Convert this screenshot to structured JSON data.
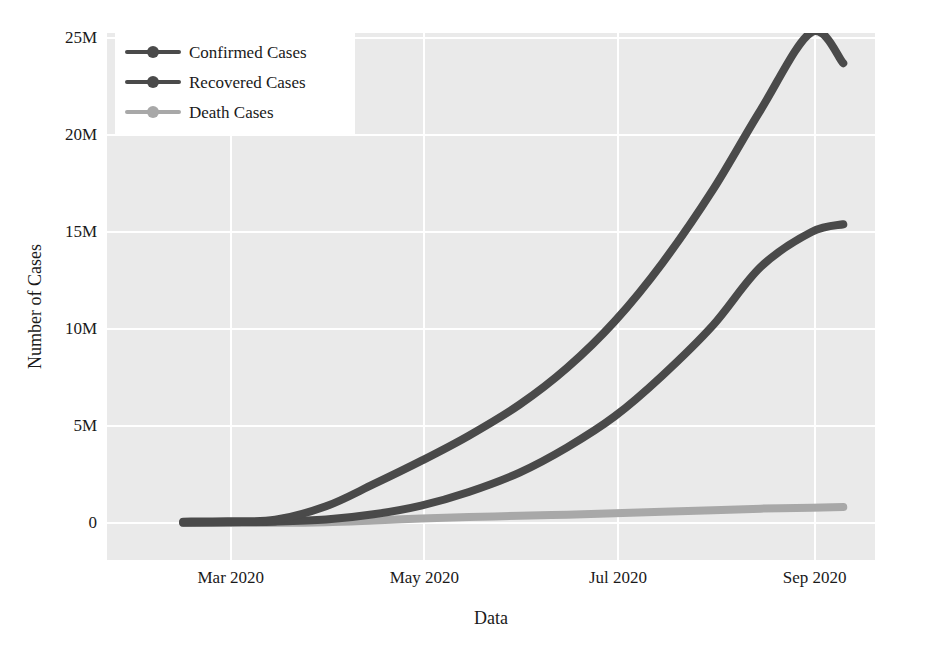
{
  "chart_data": {
    "type": "line",
    "title": "",
    "xlabel": "Data",
    "ylabel": "Number of Cases",
    "grid": true,
    "legend_position": "top-left",
    "x_tick_labels": [
      "Mar 2020",
      "May 2020",
      "Jul 2020",
      "Sep 2020"
    ],
    "x_tick_months": [
      2,
      4,
      6,
      8
    ],
    "y_tick_labels": [
      "0",
      "5M",
      "10M",
      "15M",
      "20M",
      "25M"
    ],
    "y_tick_values": [
      0,
      5000000,
      10000000,
      15000000,
      20000000,
      25000000
    ],
    "ylim": [
      0,
      25000000
    ],
    "xlim": [
      "2020-01-22",
      "2020-09-20"
    ],
    "x": [
      "2020-02-15",
      "2020-02-29",
      "2020-03-15",
      "2020-03-31",
      "2020-04-15",
      "2020-04-30",
      "2020-05-15",
      "2020-05-31",
      "2020-06-15",
      "2020-06-30",
      "2020-07-15",
      "2020-07-31",
      "2020-08-15",
      "2020-08-31",
      "2020-09-10"
    ],
    "series": [
      {
        "name": "Confirmed Cases",
        "color": "#4a4a4a",
        "values": [
          70000,
          90000,
          170000,
          860000,
          2000000,
          3200000,
          4500000,
          6100000,
          8000000,
          10400000,
          13400000,
          17200000,
          21300000,
          25300000,
          23700000
        ],
        "values_display": [
          "0.07M",
          "0.09M",
          "0.17M",
          "0.86M",
          "2.0M",
          "3.2M",
          "4.5M",
          "6.1M",
          "8.0M",
          "10.4M",
          "13.4M",
          "17.2M",
          "20.4M",
          "22.8M",
          "23.7M"
        ]
      },
      {
        "name": "Recovered Cases",
        "color": "#4a4a4a",
        "values": [
          10000,
          40000,
          70000,
          180000,
          450000,
          900000,
          1600000,
          2600000,
          3900000,
          5500000,
          7600000,
          10200000,
          13200000,
          15000000,
          15400000
        ],
        "values_display": [
          "0.01M",
          "0.04M",
          "0.07M",
          "0.18M",
          "0.45M",
          "0.9M",
          "1.6M",
          "2.6M",
          "3.9M",
          "5.5M",
          "7.6M",
          "10.2M",
          "13.2M",
          "15.0M",
          "15.4M"
        ]
      },
      {
        "name": "Death Cases",
        "color": "#a8a8a8",
        "values": [
          2000,
          3000,
          7000,
          42000,
          130000,
          230000,
          310000,
          370000,
          430000,
          500000,
          580000,
          660000,
          740000,
          790000,
          820000
        ],
        "values_display": [
          "0.002M",
          "0.003M",
          "0.007M",
          "0.04M",
          "0.13M",
          "0.23M",
          "0.31M",
          "0.37M",
          "0.43M",
          "0.50M",
          "0.58M",
          "0.66M",
          "0.74M",
          "0.79M",
          "0.82M"
        ]
      }
    ]
  },
  "legend": {
    "items": [
      {
        "label": "Confirmed Cases",
        "color": "#4a4a4a"
      },
      {
        "label": "Recovered Cases",
        "color": "#4a4a4a"
      },
      {
        "label": "Death Cases",
        "color": "#a8a8a8"
      }
    ]
  },
  "axes": {
    "y_title": "Number of Cases",
    "x_title": "Data",
    "y_ticks": [
      "0",
      "5M",
      "10M",
      "15M",
      "20M",
      "25M"
    ],
    "x_ticks": [
      "Mar 2020",
      "May 2020",
      "Jul 2020",
      "Sep 2020"
    ]
  },
  "style": {
    "plot_background": "#eaeaea",
    "grid_color": "#ffffff",
    "page_background": "#ffffff",
    "text_color": "#1a1a1a",
    "dark_series_color": "#4a4a4a",
    "light_series_color": "#a8a8a8"
  }
}
